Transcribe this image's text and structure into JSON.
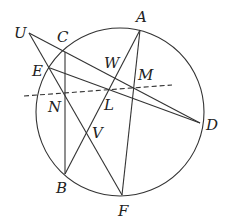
{
  "diagram": {
    "type": "geometry-circle",
    "circle": {
      "cx": 120,
      "cy": 112,
      "r": 84
    },
    "points": {
      "A": {
        "x": 140,
        "y": 30,
        "label": "A",
        "lx": 136,
        "ly": 22
      },
      "U": {
        "x": 29,
        "y": 33,
        "label": "U",
        "lx": 14,
        "ly": 38
      },
      "C": {
        "x": 65,
        "y": 52,
        "label": "C",
        "lx": 57,
        "ly": 42
      },
      "E": {
        "x": 50,
        "y": 68,
        "label": "E",
        "lx": 32,
        "ly": 76
      },
      "W": {
        "x": 118,
        "y": 72,
        "label": "W",
        "lx": 104,
        "ly": 68
      },
      "M": {
        "x": 134,
        "y": 88,
        "label": "M",
        "lx": 138,
        "ly": 80
      },
      "N": {
        "x": 65,
        "y": 93,
        "label": "N",
        "lx": 48,
        "ly": 112
      },
      "L": {
        "x": 108,
        "y": 90,
        "label": "L",
        "lx": 104,
        "ly": 110
      },
      "D": {
        "x": 200,
        "y": 123,
        "label": "D",
        "lx": 206,
        "ly": 130
      },
      "V": {
        "x": 86,
        "y": 133,
        "label": "V",
        "lx": 92,
        "ly": 138
      },
      "B": {
        "x": 65,
        "y": 174,
        "label": "B",
        "lx": 56,
        "ly": 193
      },
      "F": {
        "x": 122,
        "y": 195,
        "label": "F",
        "lx": 118,
        "ly": 216
      }
    },
    "segments": [
      {
        "from": "U",
        "to": "D",
        "style": "solid"
      },
      {
        "from": "U",
        "to": "F",
        "style": "solid"
      },
      {
        "from": "E",
        "to": "D",
        "style": "solid"
      },
      {
        "from": "C",
        "to": "B",
        "style": "solid"
      },
      {
        "from": "A",
        "to": "B",
        "style": "solid"
      },
      {
        "from": "A",
        "to": "F",
        "style": "solid"
      }
    ],
    "dashed_line": {
      "x1": 24,
      "y1": 96,
      "x2": 172,
      "y2": 85
    }
  }
}
